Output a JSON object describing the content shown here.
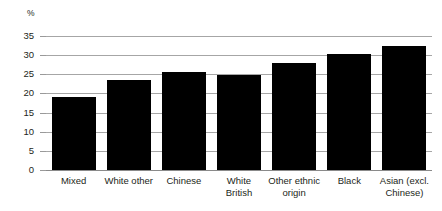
{
  "chart_data": {
    "type": "bar",
    "title": "",
    "subtitle": "",
    "xlabel": "",
    "ylabel": "%",
    "ylim": [
      0,
      35
    ],
    "ytick_step": 5,
    "yticks": [
      35,
      30,
      25,
      20,
      15,
      10,
      5,
      0
    ],
    "grid": true,
    "legend": "none",
    "orientation": "vertical",
    "bar_color": "#000000",
    "gridline_color": "#a6a6a6",
    "categories": [
      "Mixed",
      "White other",
      "Chinese",
      "White British",
      "Other ethnic origin",
      "Black",
      "Asian (excl. Chinese)"
    ],
    "category_lines": [
      [
        "Mixed"
      ],
      [
        "White other"
      ],
      [
        "Chinese"
      ],
      [
        "White",
        "British"
      ],
      [
        "Other ethnic",
        "origin"
      ],
      [
        "Black"
      ],
      [
        "Asian (excl.",
        "Chinese)"
      ]
    ],
    "values": [
      19,
      23.5,
      25.5,
      24.8,
      28,
      30.2,
      32.3
    ]
  }
}
